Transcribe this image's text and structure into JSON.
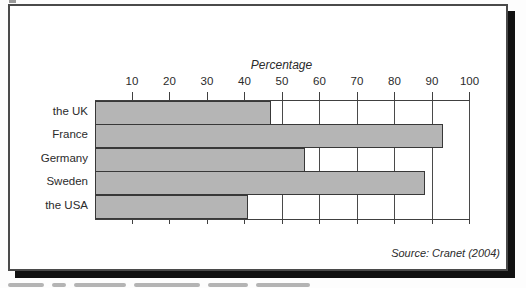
{
  "figure": {
    "source_note": "Source: Cranet (2004)"
  },
  "chart_data": {
    "type": "bar",
    "orientation": "horizontal",
    "title": "Percentage",
    "categories": [
      "the UK",
      "France",
      "Germany",
      "Sweden",
      "the USA"
    ],
    "values": [
      47,
      93,
      56,
      88,
      41
    ],
    "xlabel": "Percentage",
    "xlim": [
      0,
      100
    ],
    "xticks": [
      10,
      20,
      30,
      40,
      50,
      60,
      70,
      80,
      90,
      100
    ],
    "grid": true,
    "legend": "none",
    "bar_fill_color": "#b5b5b5",
    "bar_border_color": "#383838",
    "axis_color": "#404040"
  }
}
